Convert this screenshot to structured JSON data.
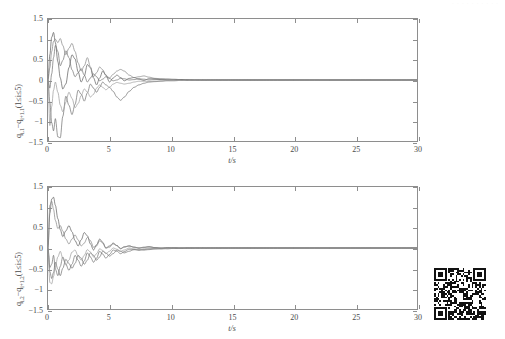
{
  "document": {
    "faint_header_text": "· · · · · · · · · ·",
    "qr_code": {
      "name": "qr-code",
      "alt": "qr-code-graphic"
    }
  },
  "charts": [
    {
      "id": "top",
      "xlabel": "t/s",
      "ylabel_html": "q<sub>i,1</sub>−q<sub>i+1,1</sub>(1≤i≤5)",
      "ylabel_plain": "q(i,1)-q(i+1,1)(1<=i<=5)",
      "xticks": [
        0,
        5,
        10,
        15,
        20,
        25,
        30
      ],
      "xticklabels": [
        "0",
        "5",
        "10",
        "15",
        "20",
        "25",
        "30"
      ],
      "yticks": [
        -1.5,
        -1,
        -0.5,
        0,
        0.5,
        1,
        1.5
      ],
      "yticklabels": [
        "-1.5",
        "-1",
        "-0.5",
        "0",
        "0.5",
        "1",
        "1.5"
      ],
      "xlim": [
        0,
        30
      ],
      "ylim": [
        -1.5,
        1.5
      ]
    },
    {
      "id": "bottom",
      "xlabel": "t/s",
      "ylabel_html": "q<sub>i,2</sub>−q<sub>i+1,2</sub>(1≤i≤5)",
      "ylabel_plain": "q(i,2)-q(i+1,2)(1<=i<=5)",
      "xticks": [
        0,
        5,
        10,
        15,
        20,
        25,
        30
      ],
      "xticklabels": [
        "0",
        "5",
        "10",
        "15",
        "20",
        "25",
        "30"
      ],
      "yticks": [
        -1.5,
        -1,
        -0.5,
        0,
        0.5,
        1,
        1.5
      ],
      "yticklabels": [
        "-1.5",
        "-1",
        "-0.5",
        "0",
        "0.5",
        "1",
        "1.5"
      ],
      "xlim": [
        0,
        30
      ],
      "ylim": [
        -1.5,
        1.5
      ]
    }
  ],
  "chart_data": [
    {
      "type": "line",
      "title": "",
      "xlabel": "t/s",
      "ylabel": "q(i,1)-q(i+1,1)(1<=i<=5)",
      "xlim": [
        0,
        30
      ],
      "ylim": [
        -1.5,
        1.5
      ],
      "grid": false,
      "legend": "none",
      "x": [
        0,
        0.15,
        0.3,
        0.45,
        0.6,
        0.8,
        1.0,
        1.2,
        1.45,
        1.7,
        1.95,
        2.2,
        2.45,
        2.7,
        2.95,
        3.2,
        3.45,
        3.7,
        3.95,
        4.2,
        4.45,
        4.7,
        5.0,
        5.3,
        5.6,
        5.9,
        6.2,
        6.6,
        7.0,
        7.4,
        7.8,
        8.2,
        8.7,
        9.2,
        9.7,
        10.2,
        10.8,
        11.4,
        12.0,
        12.6,
        13.2,
        14.0,
        15.0,
        16.5,
        18.0,
        20.0,
        22.5,
        25.0,
        27.5,
        30.0
      ],
      "series": [
        {
          "name": "q1,1 - q2,1",
          "values": [
            0.0,
            0.62,
            1.05,
            1.17,
            0.92,
            0.45,
            0.05,
            -0.22,
            -0.1,
            0.3,
            0.62,
            0.52,
            0.2,
            -0.05,
            0.1,
            0.38,
            0.3,
            0.05,
            -0.12,
            0.05,
            0.22,
            0.12,
            -0.05,
            0.05,
            0.12,
            0.06,
            -0.02,
            0.04,
            0.06,
            0.02,
            -0.01,
            0.03,
            0.03,
            0.01,
            0.0,
            0.01,
            0.01,
            0.0,
            0.0,
            0.0,
            0.0,
            0.0,
            0.0,
            0.0,
            0.0,
            0.0,
            0.0,
            0.0,
            0.0,
            0.0
          ]
        },
        {
          "name": "q2,1 - q3,1",
          "values": [
            0.0,
            -0.55,
            -1.05,
            -1.25,
            -0.95,
            -1.4,
            -1.42,
            -0.9,
            -0.4,
            -0.62,
            -0.85,
            -0.6,
            -0.25,
            -0.35,
            -0.52,
            -0.32,
            -0.1,
            -0.2,
            -0.3,
            -0.18,
            -0.05,
            -0.12,
            -0.18,
            -0.28,
            -0.42,
            -0.5,
            -0.42,
            -0.28,
            -0.18,
            -0.12,
            -0.08,
            -0.05,
            -0.04,
            -0.03,
            -0.02,
            -0.02,
            -0.01,
            -0.01,
            0.0,
            0.0,
            0.0,
            0.0,
            0.0,
            0.0,
            0.0,
            0.0,
            0.0,
            0.0,
            0.0,
            0.0
          ]
        },
        {
          "name": "q3,1 - q4,1",
          "values": [
            0.0,
            0.3,
            0.7,
            0.95,
            1.0,
            0.92,
            1.02,
            0.85,
            0.62,
            0.78,
            0.9,
            0.7,
            0.42,
            0.22,
            0.35,
            0.55,
            0.32,
            0.08,
            0.18,
            0.32,
            0.25,
            0.12,
            0.05,
            0.14,
            0.22,
            0.26,
            0.22,
            0.12,
            0.06,
            0.08,
            0.1,
            0.07,
            0.04,
            0.03,
            0.03,
            0.02,
            0.01,
            0.01,
            0.0,
            0.0,
            0.0,
            0.0,
            0.0,
            0.0,
            0.0,
            0.0,
            0.0,
            0.0,
            0.0,
            0.0
          ]
        },
        {
          "name": "q4,1 - q5,1",
          "values": [
            0.0,
            -0.2,
            0.15,
            0.55,
            0.85,
            0.7,
            0.35,
            0.48,
            0.72,
            0.55,
            0.25,
            0.08,
            0.18,
            0.28,
            0.12,
            -0.05,
            0.05,
            0.15,
            0.08,
            -0.02,
            0.02,
            0.08,
            0.04,
            -0.02,
            0.0,
            0.04,
            0.03,
            0.0,
            0.01,
            0.03,
            0.02,
            0.0,
            0.01,
            0.02,
            0.01,
            0.0,
            0.01,
            0.01,
            0.0,
            0.0,
            0.0,
            0.0,
            0.0,
            0.0,
            0.0,
            0.0,
            0.0,
            0.0,
            0.0,
            0.0
          ]
        },
        {
          "name": "q5,1 - q1,1",
          "values": [
            0.0,
            -1.12,
            -0.65,
            -0.25,
            -0.05,
            -0.3,
            -0.62,
            -0.78,
            -0.55,
            -0.3,
            -0.45,
            -0.68,
            -0.58,
            -0.38,
            -0.22,
            -0.3,
            -0.42,
            -0.35,
            -0.2,
            -0.12,
            -0.18,
            -0.24,
            -0.18,
            -0.1,
            -0.06,
            -0.08,
            -0.1,
            -0.08,
            -0.05,
            -0.03,
            -0.03,
            -0.04,
            -0.03,
            -0.02,
            -0.01,
            -0.01,
            -0.01,
            0.0,
            0.0,
            0.0,
            0.0,
            0.0,
            0.0,
            0.0,
            0.0,
            0.0,
            0.0,
            0.0,
            0.0,
            0.0
          ]
        }
      ]
    },
    {
      "type": "line",
      "title": "",
      "xlabel": "t/s",
      "ylabel": "q(i,2)-q(i+1,2)(1<=i<=5)",
      "xlim": [
        0,
        30
      ],
      "ylim": [
        -1.5,
        1.5
      ],
      "grid": false,
      "legend": "none",
      "x": [
        0,
        0.15,
        0.3,
        0.45,
        0.6,
        0.8,
        1.0,
        1.2,
        1.45,
        1.7,
        1.95,
        2.2,
        2.45,
        2.7,
        2.95,
        3.2,
        3.45,
        3.7,
        3.95,
        4.2,
        4.45,
        4.7,
        5.0,
        5.3,
        5.6,
        5.9,
        6.2,
        6.6,
        7.0,
        7.4,
        7.8,
        8.2,
        8.7,
        9.2,
        9.7,
        10.2,
        10.8,
        11.4,
        12.0,
        12.6,
        13.2,
        14.0,
        15.0,
        16.5,
        18.0,
        20.0,
        22.5,
        25.0,
        27.5,
        30.0
      ],
      "series": [
        {
          "name": "q1,2 - q2,2",
          "values": [
            0.0,
            0.85,
            1.2,
            1.25,
            1.05,
            0.72,
            0.45,
            0.28,
            0.42,
            0.55,
            0.4,
            0.18,
            0.05,
            0.2,
            0.38,
            0.3,
            0.1,
            -0.05,
            0.08,
            0.22,
            0.14,
            0.0,
            0.05,
            0.12,
            0.06,
            -0.02,
            0.03,
            0.05,
            0.02,
            0.0,
            0.02,
            0.03,
            0.01,
            0.0,
            0.01,
            0.01,
            0.0,
            0.0,
            0.0,
            0.0,
            0.0,
            0.0,
            0.0,
            0.0,
            0.0,
            0.0,
            0.0,
            0.0,
            0.0,
            0.0
          ]
        },
        {
          "name": "q2,2 - q3,2",
          "values": [
            0.0,
            -0.58,
            -0.75,
            -0.6,
            -0.35,
            -0.52,
            -0.68,
            -0.5,
            -0.28,
            -0.38,
            -0.5,
            -0.38,
            -0.18,
            -0.25,
            -0.4,
            -0.3,
            -0.12,
            -0.18,
            -0.3,
            -0.22,
            -0.08,
            -0.12,
            -0.2,
            -0.14,
            -0.05,
            -0.08,
            -0.12,
            -0.08,
            -0.04,
            -0.03,
            -0.05,
            -0.04,
            -0.02,
            -0.01,
            -0.02,
            -0.01,
            -0.01,
            0.0,
            0.0,
            0.0,
            0.0,
            0.0,
            0.0,
            0.0,
            0.0,
            0.0,
            0.0,
            0.0,
            0.0,
            0.0
          ]
        },
        {
          "name": "q3,2 - q4,2",
          "values": [
            0.0,
            1.05,
            1.15,
            0.95,
            0.68,
            0.48,
            0.55,
            0.42,
            0.22,
            0.1,
            0.22,
            0.32,
            0.2,
            0.05,
            0.12,
            0.26,
            0.18,
            0.02,
            0.05,
            0.18,
            0.12,
            0.0,
            0.02,
            0.1,
            0.06,
            -0.01,
            0.02,
            0.05,
            0.02,
            0.0,
            0.01,
            0.03,
            0.01,
            0.0,
            0.01,
            0.01,
            0.0,
            0.0,
            0.0,
            0.0,
            0.0,
            0.0,
            0.0,
            0.0,
            0.0,
            0.0,
            0.0,
            0.0,
            0.0,
            0.0
          ]
        },
        {
          "name": "q4,2 - q5,2",
          "values": [
            0.0,
            -0.48,
            -0.4,
            -0.18,
            -0.52,
            -0.68,
            -0.45,
            -0.22,
            -0.4,
            -0.55,
            -0.4,
            -0.18,
            -0.3,
            -0.45,
            -0.32,
            -0.12,
            -0.22,
            -0.35,
            -0.25,
            -0.08,
            -0.15,
            -0.25,
            -0.16,
            -0.05,
            -0.08,
            -0.14,
            -0.09,
            -0.03,
            -0.04,
            -0.06,
            -0.04,
            -0.02,
            -0.02,
            -0.02,
            -0.01,
            -0.01,
            0.0,
            0.0,
            0.0,
            0.0,
            0.0,
            0.0,
            0.0,
            0.0,
            0.0,
            0.0,
            0.0,
            0.0,
            0.0,
            0.0
          ]
        },
        {
          "name": "q5,2 - q1,2",
          "values": [
            0.0,
            -0.85,
            -0.88,
            -0.7,
            -0.45,
            -0.22,
            -0.08,
            -0.25,
            -0.42,
            -0.3,
            -0.1,
            -0.05,
            -0.2,
            -0.3,
            -0.18,
            -0.04,
            -0.1,
            -0.22,
            -0.14,
            -0.02,
            -0.06,
            -0.14,
            -0.08,
            0.0,
            -0.03,
            -0.08,
            -0.05,
            0.0,
            -0.02,
            -0.04,
            -0.02,
            0.0,
            -0.01,
            -0.02,
            -0.01,
            0.0,
            0.0,
            0.0,
            0.0,
            0.0,
            0.0,
            0.0,
            0.0,
            0.0,
            0.0,
            0.0,
            0.0,
            0.0,
            0.0,
            0.0
          ]
        }
      ]
    }
  ]
}
